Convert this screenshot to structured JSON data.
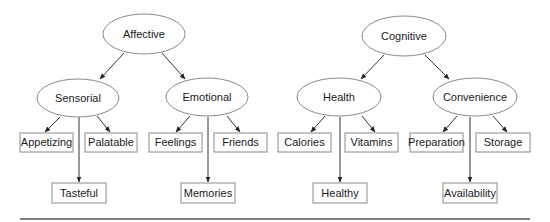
{
  "diagram": {
    "type": "hierarchy",
    "trees": [
      {
        "root": "Affective",
        "children": [
          {
            "label": "Sensorial",
            "children": [
              "Appetizing",
              "Palatable",
              "Tasteful"
            ]
          },
          {
            "label": "Emotional",
            "children": [
              "Feelings",
              "Friends",
              "Memories"
            ]
          }
        ]
      },
      {
        "root": "Cognitive",
        "children": [
          {
            "label": "Health",
            "children": [
              "Calories",
              "Vitamins",
              "Healthy"
            ]
          },
          {
            "label": "Convenience",
            "children": [
              "Preparation",
              "Storage",
              "Availability"
            ]
          }
        ]
      }
    ]
  },
  "nodes": {
    "affective": "Affective",
    "sensorial": "Sensorial",
    "emotional": "Emotional",
    "cognitive": "Cognitive",
    "health": "Health",
    "convenience": "Convenience",
    "appetizing": "Appetizing",
    "palatable": "Palatable",
    "tasteful": "Tasteful",
    "feelings": "Feelings",
    "friends": "Friends",
    "memories": "Memories",
    "calories": "Calories",
    "vitamins": "Vitamins",
    "healthy": "Healthy",
    "preparation": "Preparation",
    "storage": "Storage",
    "availability": "Availability"
  }
}
